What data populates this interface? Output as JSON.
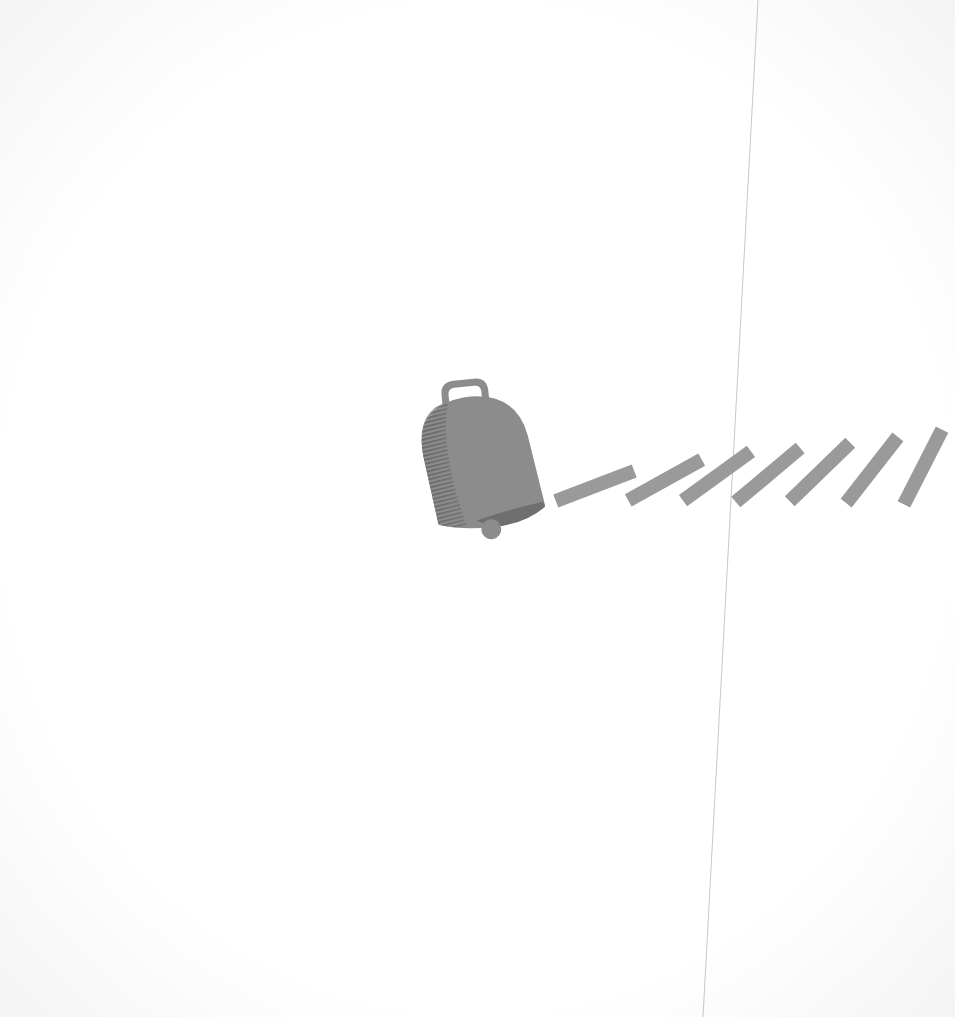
{
  "scene": {
    "description": "Cowbell illustration with motion stripes on a scanned page",
    "subject": "cowbell-icon",
    "colors": {
      "background": "#fdfdfd",
      "bell": "#8c8c8c",
      "bell_shade": "#6f6f6f",
      "stripes": "#9a9a9a",
      "crease_line": "#c8c8c8"
    },
    "stripes_count": 7
  }
}
